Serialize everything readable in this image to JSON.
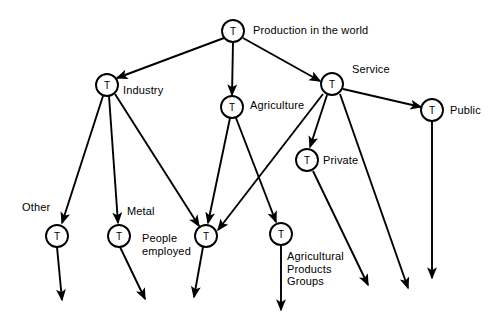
{
  "diagram": {
    "background_color": "#ffffff",
    "line_color": "#000000",
    "node_fill": "#ffffff",
    "node_letter": "T",
    "nodes": [
      {
        "id": "production",
        "label": "Production in the world",
        "letter": "T",
        "cx": 233,
        "cy": 31,
        "r": 11,
        "label_x": 253,
        "label_y": 24,
        "multiline": false
      },
      {
        "id": "industry",
        "label": "Industry",
        "letter": "T",
        "cx": 107,
        "cy": 85,
        "r": 11,
        "label_x": 123,
        "label_y": 84,
        "multiline": false
      },
      {
        "id": "agriculture",
        "label": "Agriculture",
        "letter": "T",
        "cx": 232,
        "cy": 107,
        "r": 11,
        "label_x": 250,
        "label_y": 99,
        "multiline": false
      },
      {
        "id": "service",
        "label": "Service",
        "letter": "T",
        "cx": 332,
        "cy": 84,
        "r": 11,
        "label_x": 352,
        "label_y": 63,
        "multiline": false
      },
      {
        "id": "public",
        "label": "Public",
        "letter": "T",
        "cx": 432,
        "cy": 110,
        "r": 11,
        "label_x": 450,
        "label_y": 104,
        "multiline": false
      },
      {
        "id": "private",
        "label": "Private",
        "letter": "T",
        "cx": 307,
        "cy": 160,
        "r": 11,
        "label_x": 323,
        "label_y": 154,
        "multiline": false
      },
      {
        "id": "other",
        "label": "Other",
        "letter": "T",
        "cx": 57,
        "cy": 236,
        "r": 11,
        "label_x": 22,
        "label_y": 201,
        "multiline": false
      },
      {
        "id": "metal",
        "label": "Metal",
        "letter": "T",
        "cx": 119,
        "cy": 236,
        "r": 11,
        "label_x": 127,
        "label_y": 205,
        "multiline": false
      },
      {
        "id": "people",
        "label": "People\nemployed",
        "letter": "T",
        "cx": 206,
        "cy": 236,
        "r": 11,
        "label_x": 142,
        "label_y": 232,
        "multiline": true
      },
      {
        "id": "agprod",
        "label": "Agricultural\nProducts\nGroups",
        "letter": "T",
        "cx": 281,
        "cy": 234,
        "r": 11,
        "label_x": 287,
        "label_y": 250,
        "multiline": true
      }
    ],
    "edges": [
      {
        "from": "production",
        "to": "industry",
        "x1": 224,
        "y1": 38,
        "x2": 117,
        "y2": 78,
        "arrow": true
      },
      {
        "from": "production",
        "to": "agriculture",
        "x1": 233,
        "y1": 42,
        "x2": 232,
        "y2": 95,
        "arrow": true
      },
      {
        "from": "production",
        "to": "service",
        "x1": 243,
        "y1": 38,
        "x2": 320,
        "y2": 81,
        "arrow": true
      },
      {
        "from": "service",
        "to": "public",
        "x1": 343,
        "y1": 89,
        "x2": 421,
        "y2": 107,
        "arrow": true
      },
      {
        "from": "service",
        "to": "private",
        "x1": 327,
        "y1": 95,
        "x2": 310,
        "y2": 147,
        "arrow": true
      },
      {
        "from": "service",
        "to": "people",
        "x1": 323,
        "y1": 94,
        "x2": 218,
        "y2": 230,
        "arrow": true
      },
      {
        "from": "industry",
        "to": "other",
        "x1": 103,
        "y1": 96,
        "x2": 62,
        "y2": 223,
        "arrow": true
      },
      {
        "from": "industry",
        "to": "metal",
        "x1": 109,
        "y1": 96,
        "x2": 118,
        "y2": 223,
        "arrow": true
      },
      {
        "from": "industry",
        "to": "people",
        "x1": 115,
        "y1": 94,
        "x2": 199,
        "y2": 226,
        "arrow": true
      },
      {
        "from": "agriculture",
        "to": "people",
        "x1": 230,
        "y1": 118,
        "x2": 208,
        "y2": 223,
        "arrow": true
      },
      {
        "from": "agriculture",
        "to": "agprod",
        "x1": 236,
        "y1": 118,
        "x2": 276,
        "y2": 222,
        "arrow": true
      },
      {
        "from": "other",
        "to": "dangle-other",
        "x1": 57,
        "y1": 247,
        "x2": 62,
        "y2": 300,
        "arrow": true
      },
      {
        "from": "metal",
        "to": "dangle-metal",
        "x1": 120,
        "y1": 247,
        "x2": 145,
        "y2": 299,
        "arrow": true
      },
      {
        "from": "people",
        "to": "dangle-people",
        "x1": 203,
        "y1": 247,
        "x2": 194,
        "y2": 297,
        "arrow": true
      },
      {
        "from": "agprod",
        "to": "dangle-agprod",
        "x1": 281,
        "y1": 245,
        "x2": 281,
        "y2": 310,
        "arrow": true
      },
      {
        "from": "private",
        "to": "dangle-private",
        "x1": 313,
        "y1": 171,
        "x2": 368,
        "y2": 285,
        "arrow": true
      },
      {
        "from": "service",
        "to": "dangle-service",
        "x1": 340,
        "y1": 94,
        "x2": 408,
        "y2": 288,
        "arrow": true
      },
      {
        "from": "public",
        "to": "dangle-public",
        "x1": 432,
        "y1": 121,
        "x2": 432,
        "y2": 278,
        "arrow": true
      }
    ]
  }
}
